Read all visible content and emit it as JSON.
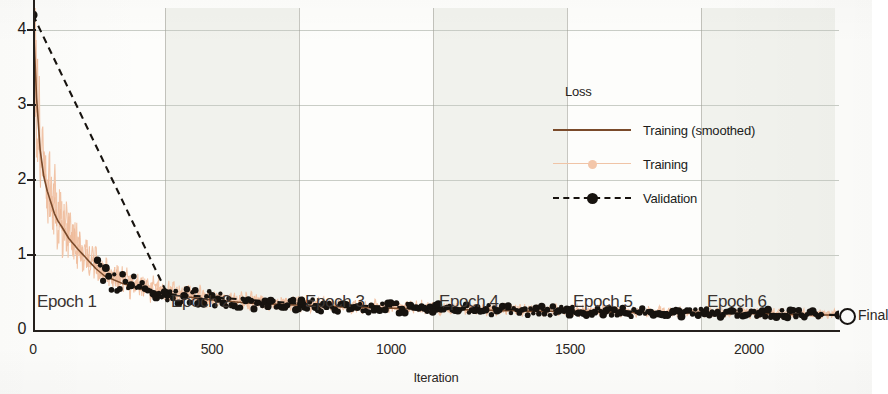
{
  "chart_data": {
    "type": "line",
    "title": "",
    "xlabel": "Iteration",
    "ylabel": "Loss",
    "xlim": [
      0,
      2250
    ],
    "ylim": [
      0,
      4.4
    ],
    "xticks": [
      0,
      500,
      1000,
      1500,
      2000
    ],
    "yticks": [
      0,
      1,
      2,
      3,
      4
    ],
    "grid": true,
    "legend": {
      "title": "Loss",
      "position": "upper-right-inside",
      "entries": [
        {
          "label": "Training (smoothed)",
          "color": "#7a4a2a",
          "style": "solid",
          "marker": "none"
        },
        {
          "label": "Training",
          "color": "#f3c6a9",
          "style": "solid",
          "marker": "circle"
        },
        {
          "label": "Validation",
          "color": "#17130f",
          "style": "dashed",
          "marker": "filled-circle"
        }
      ]
    },
    "annotations": {
      "epoch_labels": [
        "Epoch 1",
        "Epoch 2",
        "Epoch 3",
        "Epoch 4",
        "Epoch 5",
        "Epoch 6"
      ],
      "epoch_boundaries": [
        0,
        375,
        750,
        1125,
        1500,
        1875,
        2250
      ],
      "final_label": "Final"
    },
    "series": [
      {
        "name": "Training",
        "color": "#f3c6a9",
        "comment": "raw per-iteration loss, noisy envelope around the smoothed curve",
        "x": [
          0,
          10,
          20,
          30,
          40,
          50,
          60,
          70,
          80,
          90,
          100,
          125,
          150,
          175,
          200,
          250,
          300,
          350,
          400,
          450,
          500,
          600,
          700,
          800,
          900,
          1000,
          1100,
          1200,
          1300,
          1400,
          1500,
          1600,
          1700,
          1800,
          1900,
          2000,
          2100,
          2200,
          2250
        ],
        "y": [
          4.2,
          3.1,
          2.4,
          2.05,
          1.85,
          1.7,
          1.55,
          1.45,
          1.38,
          1.3,
          1.22,
          1.08,
          0.95,
          0.82,
          0.72,
          0.62,
          0.55,
          0.5,
          0.46,
          0.43,
          0.4,
          0.36,
          0.34,
          0.32,
          0.3,
          0.29,
          0.28,
          0.27,
          0.26,
          0.25,
          0.25,
          0.24,
          0.23,
          0.23,
          0.22,
          0.22,
          0.21,
          0.2,
          0.2
        ]
      },
      {
        "name": "Training (smoothed)",
        "color": "#7a4a2a",
        "comment": "smoothed training loss",
        "x": [
          0,
          10,
          20,
          30,
          40,
          50,
          60,
          70,
          80,
          90,
          100,
          125,
          150,
          175,
          200,
          250,
          300,
          350,
          400,
          450,
          500,
          600,
          700,
          800,
          900,
          1000,
          1100,
          1200,
          1300,
          1400,
          1500,
          1600,
          1700,
          1800,
          1900,
          2000,
          2100,
          2200,
          2250
        ],
        "y": [
          4.2,
          3.1,
          2.4,
          2.05,
          1.85,
          1.7,
          1.55,
          1.45,
          1.38,
          1.3,
          1.22,
          1.08,
          0.95,
          0.82,
          0.72,
          0.62,
          0.55,
          0.5,
          0.46,
          0.43,
          0.4,
          0.36,
          0.34,
          0.32,
          0.3,
          0.29,
          0.28,
          0.27,
          0.26,
          0.25,
          0.25,
          0.24,
          0.23,
          0.23,
          0.22,
          0.22,
          0.21,
          0.2,
          0.2
        ]
      },
      {
        "name": "Validation",
        "color": "#17130f",
        "comment": "validation loss evaluated periodically",
        "x": [
          0,
          375,
          750,
          1125,
          1500,
          1875,
          2250
        ],
        "y": [
          4.2,
          0.48,
          0.35,
          0.29,
          0.26,
          0.23,
          0.2
        ]
      }
    ]
  },
  "axes": {
    "ylabel": "Loss",
    "xlabel": "Iteration",
    "yticks": [
      {
        "value": 4,
        "label": "4"
      },
      {
        "value": 3,
        "label": "3"
      },
      {
        "value": 2,
        "label": "2"
      },
      {
        "value": 1,
        "label": "1"
      },
      {
        "value": 0,
        "label": "0"
      }
    ],
    "xticks": [
      {
        "value": 0,
        "label": "0"
      },
      {
        "value": 500,
        "label": "500"
      },
      {
        "value": 1000,
        "label": "1000"
      },
      {
        "value": 1500,
        "label": "1500"
      },
      {
        "value": 2000,
        "label": "2000"
      }
    ]
  },
  "epochs": [
    {
      "label": "Epoch 1",
      "start": 0,
      "end": 375,
      "shaded": false
    },
    {
      "label": "Epoch 2",
      "start": 375,
      "end": 750,
      "shaded": true
    },
    {
      "label": "Epoch 3",
      "start": 750,
      "end": 1125,
      "shaded": false
    },
    {
      "label": "Epoch 4",
      "start": 1125,
      "end": 1500,
      "shaded": true
    },
    {
      "label": "Epoch 5",
      "start": 1500,
      "end": 1875,
      "shaded": false
    },
    {
      "label": "Epoch 6",
      "start": 1875,
      "end": 2250,
      "shaded": true
    }
  ],
  "legend": {
    "title": "Loss",
    "items": [
      {
        "label": "Training (smoothed)"
      },
      {
        "label": "Training"
      },
      {
        "label": "Validation"
      }
    ]
  },
  "final": {
    "label": "Final"
  },
  "colors": {
    "smoothed": "#7a4a2a",
    "raw": "#f3c6a9",
    "validation": "#17130f",
    "band": "#eef0ea",
    "grid": "#c9cdc6",
    "axis": "#241f1c"
  }
}
